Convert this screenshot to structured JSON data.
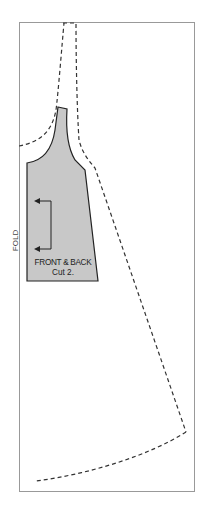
{
  "diagram": {
    "type": "sewing-pattern",
    "fold_label": "FOLD",
    "piece": {
      "title": "FRONT & BACK",
      "instruction": "Cut 2.",
      "fill_color": "#c8c8c8",
      "stroke_color": "#222222"
    },
    "frame_color": "#999999",
    "dashed_line_color": "#333333",
    "grainline": {
      "direction": "toward-fold",
      "arrows": 2
    }
  }
}
